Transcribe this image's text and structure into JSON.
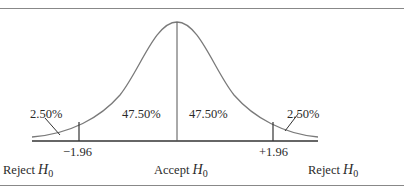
{
  "diagram": {
    "critical_values": {
      "left": "−1.96",
      "right": "+1.96"
    },
    "areas": {
      "left_tail": "2.50%",
      "left_center": "47.50%",
      "right_center": "47.50%",
      "right_tail": "2.50%"
    },
    "regions": {
      "left": {
        "text": "Reject ",
        "symbol": "H",
        "sub": "0"
      },
      "center": {
        "text": "Accept ",
        "symbol": "H",
        "sub": "0"
      },
      "right": {
        "text": "Reject ",
        "symbol": "H",
        "sub": "0"
      }
    },
    "colors": {
      "curve": "#7a7a7a",
      "axis": "#333333",
      "rule": "#888888"
    }
  }
}
